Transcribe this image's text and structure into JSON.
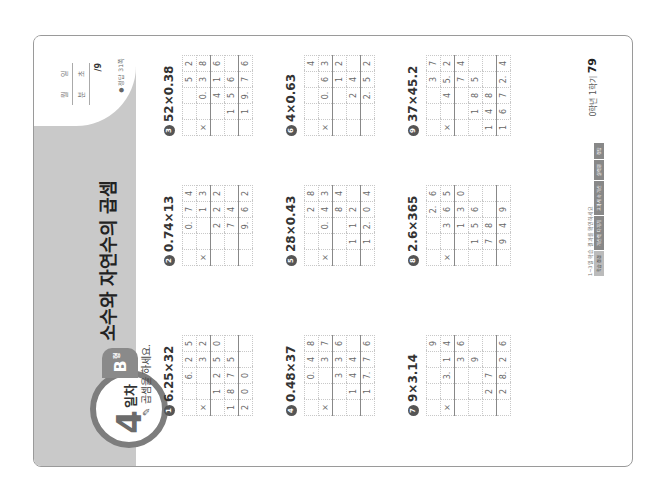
{
  "header": {
    "day_number": "4",
    "day_label": "일차",
    "level": "B",
    "level_suffix": "형",
    "title": "소수와 자연수의 곱셈",
    "score_box": {
      "month_label": "월",
      "day_label": "일",
      "min_label": "분",
      "sec_label": "초",
      "score": "/9"
    },
    "answer_ref": "● 정답 31쪽"
  },
  "instruction": "곱셈을 하세요.",
  "problems": [
    {
      "num": "1",
      "expr": "6.25×32",
      "rows": [
        [
          "",
          "",
          "6.",
          "2",
          "5"
        ],
        [
          "×",
          "",
          "",
          "3",
          "2"
        ],
        [
          "",
          "1",
          "2",
          "5",
          "0"
        ],
        [
          "1",
          "8",
          "7",
          "5",
          ""
        ],
        [
          "2",
          "0",
          "0",
          "",
          ""
        ]
      ]
    },
    {
      "num": "2",
      "expr": "0.74×13",
      "rows": [
        [
          "",
          "",
          "0.",
          "7",
          "4"
        ],
        [
          "×",
          "",
          "",
          "1",
          "3"
        ],
        [
          "",
          "",
          "2",
          "2",
          "2"
        ],
        [
          "",
          "",
          "7",
          "4",
          ""
        ],
        [
          "",
          "",
          "9.",
          "6",
          "2"
        ]
      ]
    },
    {
      "num": "3",
      "expr": "52×0.38",
      "rows": [
        [
          "",
          "",
          "",
          "5",
          "2"
        ],
        [
          "×",
          "",
          "0.",
          "3",
          "8"
        ],
        [
          "",
          "",
          "4",
          "1",
          "6"
        ],
        [
          "",
          "1",
          "5",
          "6",
          ""
        ],
        [
          "",
          "1",
          "9.",
          "7",
          "6"
        ]
      ]
    },
    {
      "num": "4",
      "expr": "0.48×37",
      "rows": [
        [
          "",
          "",
          "0.",
          "4",
          "8"
        ],
        [
          "×",
          "",
          "",
          "3",
          "7"
        ],
        [
          "",
          "",
          "3",
          "3",
          "6"
        ],
        [
          "",
          "1",
          "4",
          "4",
          ""
        ],
        [
          "",
          "1",
          "7.",
          "7",
          "6"
        ]
      ]
    },
    {
      "num": "5",
      "expr": "28×0.43",
      "rows": [
        [
          "",
          "",
          "",
          "2",
          "8"
        ],
        [
          "×",
          "",
          "0.",
          "4",
          "3"
        ],
        [
          "",
          "",
          "",
          "8",
          "4"
        ],
        [
          "",
          "1",
          "1",
          "2",
          ""
        ],
        [
          "",
          "1",
          "2.",
          "0",
          "4"
        ]
      ]
    },
    {
      "num": "6",
      "expr": "4×0.63",
      "rows": [
        [
          "",
          "",
          "",
          "",
          "4"
        ],
        [
          "×",
          "",
          "0.",
          "6",
          "3"
        ],
        [
          "",
          "",
          "",
          "1",
          "2"
        ],
        [
          "",
          "",
          "2",
          "4",
          ""
        ],
        [
          "",
          "",
          "2.",
          "5",
          "2"
        ]
      ]
    },
    {
      "num": "7",
      "expr": "9×3.14",
      "rows": [
        [
          "",
          "",
          "",
          "",
          "9"
        ],
        [
          "×",
          "",
          "3.",
          "1",
          "4"
        ],
        [
          "",
          "",
          "",
          "3",
          "6"
        ],
        [
          "",
          "",
          "",
          "9",
          ""
        ],
        [
          "",
          "2",
          "7",
          "",
          ""
        ],
        [
          "",
          "2",
          "8.",
          "2",
          "6"
        ]
      ]
    },
    {
      "num": "8",
      "expr": "2.6×365",
      "rows": [
        [
          "",
          "",
          "",
          "2.",
          "6"
        ],
        [
          "×",
          "",
          "3",
          "6",
          "5"
        ],
        [
          "",
          "",
          "1",
          "3",
          "0"
        ],
        [
          "",
          "1",
          "5",
          "6",
          ""
        ],
        [
          "",
          "7",
          "8",
          "",
          ""
        ],
        [
          "",
          "9",
          "4",
          "9",
          ""
        ]
      ]
    },
    {
      "num": "9",
      "expr": "37×45.2",
      "rows": [
        [
          "",
          "",
          "",
          "3",
          "7"
        ],
        [
          "×",
          "",
          "4",
          "5.",
          "2"
        ],
        [
          "",
          "",
          "",
          "7",
          "4"
        ],
        [
          "",
          "1",
          "8",
          "5",
          ""
        ],
        [
          "1",
          "4",
          "8",
          "",
          ""
        ],
        [
          "1",
          "6",
          "7",
          "2.",
          "4"
        ]
      ]
    }
  ],
  "footer": {
    "note": "1~3일 학습 결과를 확인하세요",
    "nav": [
      "학습 점검",
      "계산력 다지기",
      "교과서 속 계산",
      "실력편",
      "정답"
    ],
    "page_label": "0학년 1학기",
    "page_number": "79"
  }
}
